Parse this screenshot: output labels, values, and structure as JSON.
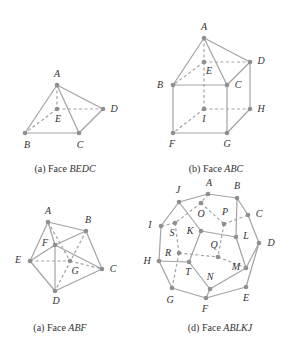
{
  "figures": [
    {
      "id": "a1",
      "caption_prefix": "(a) Face ",
      "caption_face": "BEDC",
      "vertices": [
        "A",
        "B",
        "C",
        "D",
        "E"
      ],
      "solid_edges": [
        [
          "A",
          "B"
        ],
        [
          "A",
          "C"
        ],
        [
          "A",
          "D"
        ],
        [
          "B",
          "C"
        ],
        [
          "C",
          "D"
        ]
      ],
      "dashed_edges": [
        [
          "A",
          "E"
        ],
        [
          "E",
          "D"
        ],
        [
          "E",
          "B"
        ]
      ]
    },
    {
      "id": "b",
      "caption_prefix": "(b) Face ",
      "caption_face": "ABC",
      "vertices": [
        "A",
        "B",
        "C",
        "D",
        "E",
        "F",
        "G",
        "H",
        "I"
      ],
      "solid_edges": [
        [
          "A",
          "B"
        ],
        [
          "A",
          "C"
        ],
        [
          "A",
          "D"
        ],
        [
          "B",
          "C"
        ],
        [
          "C",
          "D"
        ],
        [
          "B",
          "F"
        ],
        [
          "C",
          "G"
        ],
        [
          "D",
          "H"
        ],
        [
          "F",
          "G"
        ],
        [
          "G",
          "H"
        ]
      ],
      "dashed_edges": [
        [
          "A",
          "E"
        ],
        [
          "E",
          "B"
        ],
        [
          "E",
          "D"
        ],
        [
          "E",
          "I"
        ],
        [
          "I",
          "F"
        ],
        [
          "I",
          "H"
        ]
      ]
    },
    {
      "id": "a2",
      "caption_prefix": "(a) Face ",
      "caption_face": "ABF",
      "vertices": [
        "A",
        "B",
        "C",
        "D",
        "E",
        "F",
        "G"
      ],
      "solid_edges": [
        [
          "A",
          "B"
        ],
        [
          "A",
          "E"
        ],
        [
          "A",
          "F"
        ],
        [
          "B",
          "F"
        ],
        [
          "B",
          "C"
        ],
        [
          "E",
          "F"
        ],
        [
          "F",
          "C"
        ],
        [
          "F",
          "D"
        ],
        [
          "E",
          "D"
        ],
        [
          "D",
          "C"
        ]
      ],
      "dashed_edges": [
        [
          "A",
          "G"
        ],
        [
          "B",
          "D"
        ],
        [
          "E",
          "G"
        ],
        [
          "G",
          "C"
        ]
      ]
    },
    {
      "id": "d",
      "caption_prefix": "(d) Face ",
      "caption_face": "ABLKJ",
      "vertices": [
        "A",
        "B",
        "C",
        "D",
        "E",
        "F",
        "G",
        "H",
        "I",
        "J",
        "K",
        "L",
        "M",
        "N",
        "O",
        "P",
        "Q",
        "R",
        "S",
        "T"
      ],
      "solid_edges": [
        [
          "J",
          "A"
        ],
        [
          "A",
          "B"
        ],
        [
          "B",
          "C"
        ],
        [
          "C",
          "D"
        ],
        [
          "D",
          "E"
        ],
        [
          "E",
          "F"
        ],
        [
          "F",
          "G"
        ],
        [
          "G",
          "H"
        ],
        [
          "H",
          "I"
        ],
        [
          "I",
          "J"
        ],
        [
          "J",
          "K"
        ],
        [
          "K",
          "L"
        ],
        [
          "L",
          "B"
        ],
        [
          "K",
          "T"
        ],
        [
          "T",
          "H"
        ],
        [
          "T",
          "N"
        ],
        [
          "N",
          "F"
        ],
        [
          "N",
          "M"
        ],
        [
          "M",
          "L"
        ],
        [
          "M",
          "D"
        ]
      ],
      "dashed_edges": [
        [
          "A",
          "O"
        ],
        [
          "O",
          "P"
        ],
        [
          "O",
          "S"
        ],
        [
          "P",
          "C"
        ],
        [
          "P",
          "Q"
        ],
        [
          "S",
          "I"
        ],
        [
          "S",
          "R"
        ],
        [
          "R",
          "G"
        ],
        [
          "R",
          "Q"
        ],
        [
          "Q",
          "M"
        ]
      ]
    }
  ],
  "colors": {
    "edge": "#a3a3a3",
    "vertex": "#8f8f8f",
    "text": "#333333"
  }
}
